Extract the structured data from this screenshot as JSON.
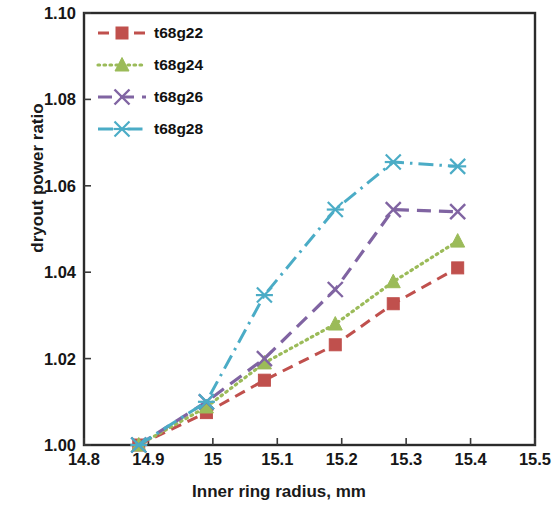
{
  "chart_data": {
    "type": "line",
    "title": "",
    "xlabel": "Inner ring radius, mm",
    "ylabel": "dryout power ratio",
    "xlim": [
      14.8,
      15.5
    ],
    "ylim": [
      1.0,
      1.1
    ],
    "xticks": [
      "14.8",
      "14.9",
      "15",
      "15.1",
      "15.2",
      "15.3",
      "15.4",
      "15.5"
    ],
    "xtick_values": [
      14.8,
      14.9,
      15.0,
      15.1,
      15.2,
      15.3,
      15.4,
      15.5
    ],
    "yticks": [
      "1.00",
      "1.02",
      "1.04",
      "1.06",
      "1.08",
      "1.10"
    ],
    "ytick_values": [
      1.0,
      1.02,
      1.04,
      1.06,
      1.08,
      1.1
    ],
    "grid": false,
    "legend_position": "top-left-inside",
    "series": [
      {
        "name": "t68g22",
        "color": "#c0504d",
        "marker": "square",
        "dash": "dashed",
        "x": [
          14.885,
          14.99,
          15.08,
          15.19,
          15.28,
          15.38
        ],
        "y": [
          1.0,
          1.0075,
          1.015,
          1.0232,
          1.0327,
          1.041
        ]
      },
      {
        "name": "t68g24",
        "color": "#9bbb59",
        "marker": "triangle",
        "dash": "dotted",
        "x": [
          14.885,
          14.99,
          15.08,
          15.19,
          15.28,
          15.38
        ],
        "y": [
          1.0,
          1.0088,
          1.019,
          1.028,
          1.0378,
          1.0472
        ]
      },
      {
        "name": "t68g26",
        "color": "#8064a2",
        "marker": "cross",
        "dash": "longdash",
        "x": [
          14.885,
          14.99,
          15.08,
          15.19,
          15.28,
          15.38
        ],
        "y": [
          1.0,
          1.01,
          1.02,
          1.036,
          1.0545,
          1.054
        ]
      },
      {
        "name": "t68g28",
        "color": "#4bacc6",
        "marker": "asterisk",
        "dash": "dashdot",
        "x": [
          14.885,
          14.99,
          15.08,
          15.19,
          15.28,
          15.38
        ],
        "y": [
          1.0,
          1.01,
          1.0347,
          1.0545,
          1.0655,
          1.0645
        ]
      }
    ]
  },
  "legend": {
    "entries": [
      {
        "label": "t68g22"
      },
      {
        "label": "t68g24"
      },
      {
        "label": "t68g26"
      },
      {
        "label": "t68g28"
      }
    ]
  },
  "axes": {
    "x_title": "Inner ring radius, mm",
    "y_title": "dryout power ratio"
  }
}
